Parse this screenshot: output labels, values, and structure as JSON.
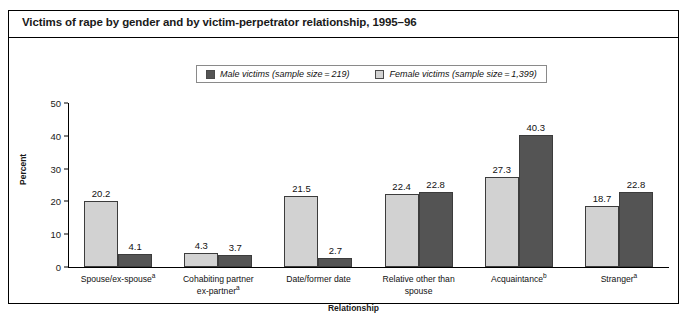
{
  "figure": {
    "title": "Victims of rape by gender and by victim-perpetrator relationship, 1995–96"
  },
  "legend": {
    "items": [
      {
        "label": "Male victims (sample size = 219)",
        "color": "#545454",
        "icon": "legend-swatch-icon"
      },
      {
        "label": "Female victims (sample size = 1,399)",
        "color": "#d2d2d2",
        "icon": "legend-swatch-icon"
      }
    ]
  },
  "axes": {
    "y_title": "Percent",
    "x_title": "Relationship",
    "y_ticks": [
      "0",
      "10",
      "20",
      "30",
      "40",
      "50"
    ]
  },
  "chart_data": {
    "type": "bar",
    "title": "Victims of rape by gender and by victim-perpetrator relationship, 1995–96",
    "xlabel": "Relationship",
    "ylabel": "Percent",
    "ylim": [
      0,
      50
    ],
    "ytick_step": 10,
    "grid": false,
    "legend_position": "top-center",
    "categories": [
      "Spouse/ex-spouseᵃ",
      "Cohabiting partner ex-partnerᵃ",
      "Date/former date",
      "Relative other than spouse",
      "Acquaintanceᵇ",
      "Strangerᵃ"
    ],
    "category_lines": [
      [
        "Spouse/ex-spouse",
        "a",
        ""
      ],
      [
        "Cohabiting partner",
        "",
        "ex-partner",
        "a"
      ],
      [
        "Date/former date",
        "",
        ""
      ],
      [
        "Relative other than",
        "",
        "spouse"
      ],
      [
        "Acquaintance",
        "b",
        ""
      ],
      [
        "Stranger",
        "a",
        ""
      ]
    ],
    "series": [
      {
        "name": "Female victims (sample size = 1,399)",
        "color": "#d2d2d2",
        "values": [
          20.2,
          4.3,
          21.5,
          22.4,
          27.3,
          18.7
        ]
      },
      {
        "name": "Male victims (sample size = 219)",
        "color": "#545454",
        "values": [
          4.1,
          3.7,
          2.7,
          22.8,
          40.3,
          22.8
        ]
      }
    ]
  },
  "groups": [
    {
      "line1": "Spouse/ex-spouse",
      "sup1": "a",
      "line2": "",
      "sup2": "",
      "light": "20.2",
      "dark": "4.1"
    },
    {
      "line1": "Cohabiting partner",
      "sup1": "",
      "line2": "ex-partner",
      "sup2": "a",
      "light": "4.3",
      "dark": "3.7"
    },
    {
      "line1": "Date/former date",
      "sup1": "",
      "line2": "",
      "sup2": "",
      "light": "21.5",
      "dark": "2.7"
    },
    {
      "line1": "Relative other than",
      "sup1": "",
      "line2": "spouse",
      "sup2": "",
      "light": "22.4",
      "dark": "22.8"
    },
    {
      "line1": "Acquaintance",
      "sup1": "b",
      "line2": "",
      "sup2": "",
      "light": "27.3",
      "dark": "40.3"
    },
    {
      "line1": "Stranger",
      "sup1": "a",
      "line2": "",
      "sup2": "",
      "light": "18.7",
      "dark": "22.8"
    }
  ]
}
